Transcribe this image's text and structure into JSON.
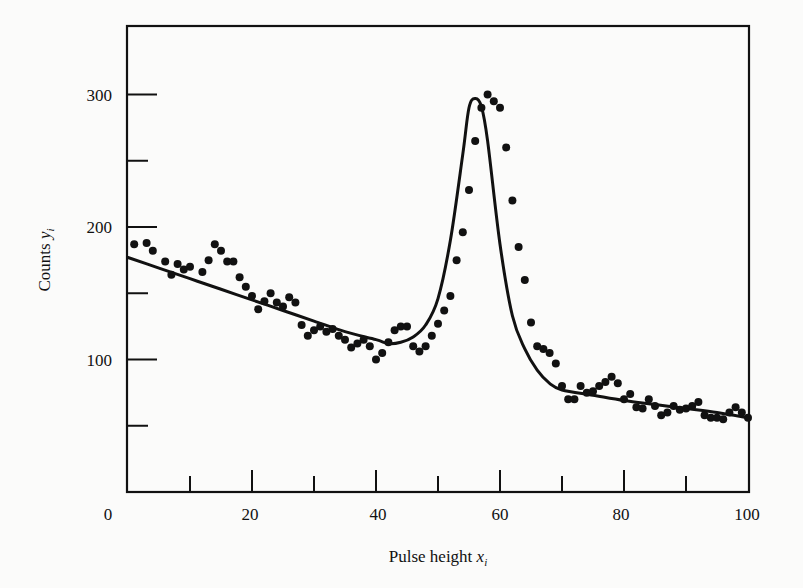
{
  "chart_data": {
    "type": "scatter",
    "title": "",
    "xlabel": "Pulse height x_i",
    "ylabel": "Counts y_i",
    "xlabel_parts": {
      "text": "Pulse height ",
      "var": "x",
      "sub": "i"
    },
    "ylabel_parts": {
      "text": "Counts ",
      "var": "y",
      "sub": "i"
    },
    "xlim": [
      0,
      100
    ],
    "ylim": [
      0,
      350
    ],
    "grid": false,
    "legend": null,
    "x_ticks_major": [
      0,
      20,
      40,
      60,
      80,
      100
    ],
    "x_ticks_minor": [
      10,
      30,
      50,
      70,
      90
    ],
    "x_tick_labels": [
      "0",
      "20",
      "40",
      "60",
      "80",
      "100"
    ],
    "y_ticks_major": [
      100,
      200,
      300
    ],
    "y_ticks_minor": [
      50,
      150,
      250
    ],
    "y_tick_labels": [
      "100",
      "200",
      "300"
    ],
    "series": [
      {
        "name": "data",
        "style": "points",
        "x": [
          1,
          3,
          4,
          6,
          7,
          8,
          9,
          10,
          12,
          13,
          14,
          15,
          16,
          17,
          18,
          19,
          20,
          21,
          22,
          23,
          24,
          25,
          26,
          27,
          28,
          29,
          30,
          31,
          32,
          33,
          34,
          35,
          36,
          37,
          38,
          39,
          40,
          41,
          42,
          43,
          44,
          45,
          46,
          47,
          48,
          49,
          50,
          51,
          52,
          53,
          54,
          55,
          56,
          57,
          58,
          59,
          60,
          61,
          62,
          63,
          64,
          65,
          66,
          67,
          68,
          69,
          70,
          71,
          72,
          73,
          74,
          75,
          76,
          77,
          78,
          79,
          80,
          81,
          82,
          83,
          84,
          85,
          86,
          87,
          88,
          89,
          90,
          91,
          92,
          93,
          94,
          95,
          96,
          97,
          98,
          99,
          100
        ],
        "y": [
          187,
          188,
          182,
          174,
          164,
          172,
          168,
          170,
          166,
          175,
          187,
          182,
          174,
          174,
          162,
          155,
          148,
          138,
          144,
          150,
          143,
          140,
          147,
          143,
          126,
          118,
          122,
          125,
          121,
          123,
          118,
          115,
          109,
          112,
          115,
          110,
          100,
          105,
          113,
          122,
          125,
          125,
          110,
          106,
          110,
          118,
          127,
          137,
          148,
          175,
          196,
          228,
          265,
          290,
          300,
          295,
          290,
          260,
          220,
          185,
          160,
          128,
          110,
          108,
          105,
          97,
          80,
          70,
          70,
          80,
          75,
          76,
          80,
          83,
          87,
          82,
          70,
          74,
          64,
          63,
          70,
          65,
          58,
          60,
          65,
          62,
          63,
          65,
          68,
          58,
          56,
          56,
          55,
          60,
          64,
          60,
          56
        ],
        "marker": "filled-circle",
        "color": "#111111"
      },
      {
        "name": "fit",
        "style": "line",
        "x": [
          0,
          5,
          10,
          15,
          20,
          25,
          30,
          35,
          40,
          42,
          44,
          46,
          48,
          50,
          52,
          54,
          55,
          56,
          57,
          58,
          60,
          62,
          64,
          66,
          68,
          70,
          75,
          80,
          85,
          90,
          95,
          100
        ],
        "y": [
          177,
          169,
          161,
          153,
          145,
          137,
          129,
          121,
          115,
          112,
          113,
          117,
          126,
          146,
          190,
          255,
          290,
          297,
          291,
          265,
          187,
          133,
          108,
          92,
          82,
          77,
          73,
          69,
          66,
          63,
          60,
          56
        ],
        "color": "#111111"
      }
    ]
  }
}
